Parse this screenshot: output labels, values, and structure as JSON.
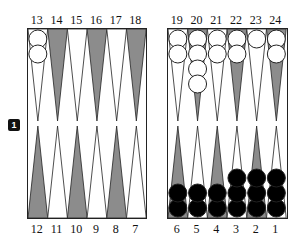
{
  "colors": {
    "dark_point": "#8c8c8c",
    "light_point": "#ffffff",
    "white_checker": "#ffffff",
    "black_checker": "#000000",
    "outline": "#222222"
  },
  "doubling_cube": {
    "value": "1"
  },
  "top_labels": [
    "13",
    "14",
    "15",
    "16",
    "17",
    "18",
    "19",
    "20",
    "21",
    "22",
    "23",
    "24"
  ],
  "bottom_labels": [
    "12",
    "11",
    "10",
    "9",
    "8",
    "7",
    "6",
    "5",
    "4",
    "3",
    "2",
    "1"
  ],
  "points": {
    "top": [
      {
        "point": "13",
        "shade": "light",
        "checkers": 2,
        "color": "white"
      },
      {
        "point": "14",
        "shade": "dark",
        "checkers": 0,
        "color": ""
      },
      {
        "point": "15",
        "shade": "light",
        "checkers": 0,
        "color": ""
      },
      {
        "point": "16",
        "shade": "dark",
        "checkers": 0,
        "color": ""
      },
      {
        "point": "17",
        "shade": "light",
        "checkers": 0,
        "color": ""
      },
      {
        "point": "18",
        "shade": "dark",
        "checkers": 0,
        "color": ""
      },
      {
        "point": "19",
        "shade": "light",
        "checkers": 2,
        "color": "white"
      },
      {
        "point": "20",
        "shade": "dark",
        "checkers": 4,
        "color": "white"
      },
      {
        "point": "21",
        "shade": "light",
        "checkers": 2,
        "color": "white"
      },
      {
        "point": "22",
        "shade": "dark",
        "checkers": 2,
        "color": "white"
      },
      {
        "point": "23",
        "shade": "light",
        "checkers": 1,
        "color": "white"
      },
      {
        "point": "24",
        "shade": "dark",
        "checkers": 2,
        "color": "white"
      }
    ],
    "bottom": [
      {
        "point": "12",
        "shade": "dark",
        "checkers": 0,
        "color": ""
      },
      {
        "point": "11",
        "shade": "light",
        "checkers": 0,
        "color": ""
      },
      {
        "point": "10",
        "shade": "dark",
        "checkers": 0,
        "color": ""
      },
      {
        "point": "9",
        "shade": "light",
        "checkers": 0,
        "color": ""
      },
      {
        "point": "8",
        "shade": "dark",
        "checkers": 0,
        "color": ""
      },
      {
        "point": "7",
        "shade": "light",
        "checkers": 0,
        "color": ""
      },
      {
        "point": "6",
        "shade": "dark",
        "checkers": 2,
        "color": "black"
      },
      {
        "point": "5",
        "shade": "light",
        "checkers": 2,
        "color": "black"
      },
      {
        "point": "4",
        "shade": "dark",
        "checkers": 2,
        "color": "black"
      },
      {
        "point": "3",
        "shade": "light",
        "checkers": 3,
        "color": "black"
      },
      {
        "point": "2",
        "shade": "dark",
        "checkers": 3,
        "color": "black"
      },
      {
        "point": "1",
        "shade": "light",
        "checkers": 3,
        "color": "black"
      }
    ]
  }
}
